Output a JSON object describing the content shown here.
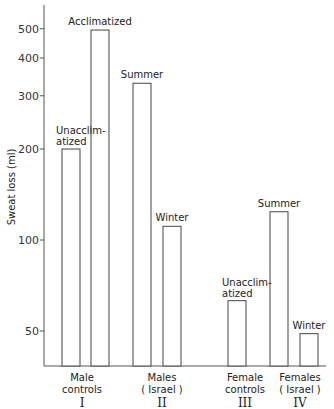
{
  "chart_data": {
    "type": "bar",
    "title": "",
    "ylabel": "Sweat loss (ml)",
    "xlabel": "",
    "yscale": "log",
    "ylim": [
      35,
      560
    ],
    "yticks": [
      50,
      100,
      200,
      300,
      400,
      500
    ],
    "grid": false,
    "legend": null,
    "groups": [
      {
        "numeral": "I",
        "label_line1": "Male",
        "label_line2": "controls",
        "bars": [
          {
            "label_line1": "Unacclim-",
            "label_line2": "atized",
            "value": 200
          },
          {
            "label_line1": "Acclimatized",
            "label_line2": "",
            "value": 495
          }
        ]
      },
      {
        "numeral": "II",
        "label_line1": "Males",
        "label_line2": "( Israel )",
        "bars": [
          {
            "label_line1": "Summer",
            "label_line2": "",
            "value": 330
          },
          {
            "label_line1": "Winter",
            "label_line2": "",
            "value": 111
          }
        ]
      },
      {
        "numeral": "III",
        "label_line1": "Female",
        "label_line2": "controls",
        "bars": [
          {
            "label_line1": "Unacclim-",
            "label_line2": "atized",
            "value": 63
          }
        ]
      },
      {
        "numeral": "IV",
        "label_line1": "Females",
        "label_line2": "( Israel )",
        "bars": [
          {
            "label_line1": "Summer",
            "label_line2": "",
            "value": 124
          },
          {
            "label_line1": "Winter",
            "label_line2": "",
            "value": 49
          }
        ]
      }
    ],
    "categories": [
      "Male controls - Unacclimatized",
      "Male controls - Acclimatized",
      "Males (Israel) - Summer",
      "Males (Israel) - Winter",
      "Female controls - Unacclimatized",
      "Females (Israel) - Summer",
      "Females (Israel) - Winter"
    ],
    "values": [
      200,
      495,
      330,
      111,
      63,
      124,
      49
    ]
  },
  "layout": {
    "axis_x": 44,
    "axis_top": 5,
    "baseline_y": 366,
    "baseline_right": 326,
    "y100_px": 240,
    "px_per_doubling": 91,
    "bar_width": 18,
    "bar_x": [
      62,
      91,
      133,
      163,
      228,
      270,
      300
    ],
    "group_label_x": [
      82,
      162,
      245,
      300
    ]
  }
}
